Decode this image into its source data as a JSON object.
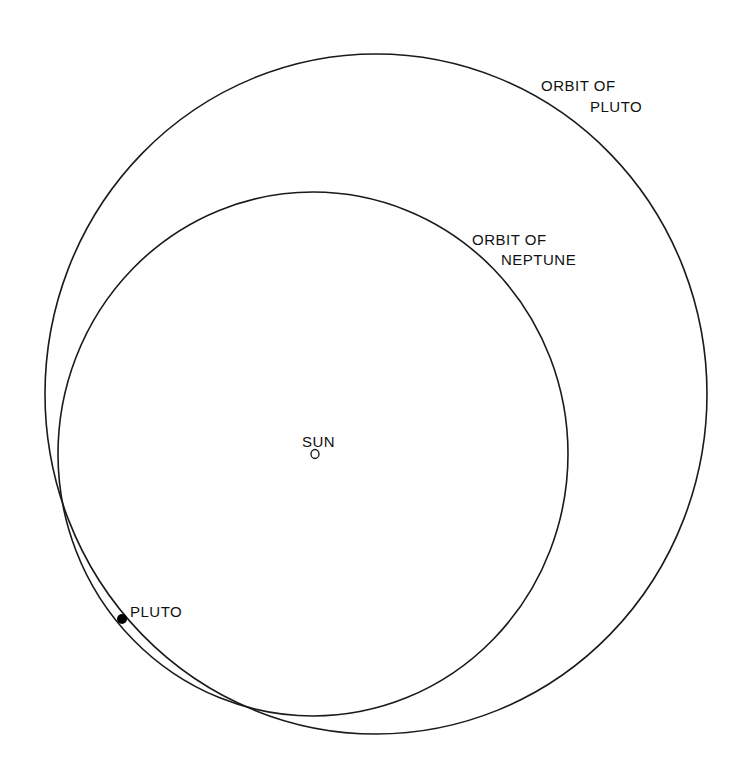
{
  "diagram": {
    "title": "",
    "colors": {
      "line": "#1a1a1a",
      "text": "#111111",
      "background": "#ffffff"
    },
    "orbits": [
      {
        "name": "pluto",
        "label_line1": "ORBIT OF",
        "label_line2": "PLUTO",
        "center": [
          376,
          394
        ],
        "rx": 331,
        "ry": 340
      },
      {
        "name": "neptune",
        "label_line1": "ORBIT OF",
        "label_line2": "NEPTUNE",
        "center": [
          313,
          454
        ],
        "rx": 255,
        "ry": 262
      }
    ],
    "sun": {
      "label": "SUN",
      "marker": "O",
      "position": [
        314,
        453
      ]
    },
    "pluto_body": {
      "label": "PLUTO",
      "position": [
        122,
        619
      ],
      "radius": 5
    }
  }
}
